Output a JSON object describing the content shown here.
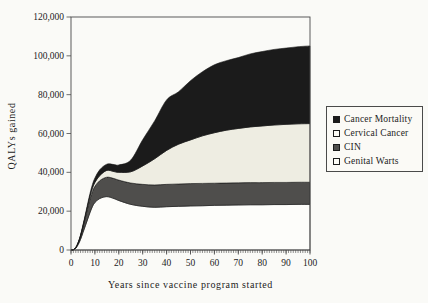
{
  "figure": {
    "background": "#fafaf7",
    "frame_color": "#4a4a4a",
    "text_color": "#1c1c1c"
  },
  "legend": {
    "items": [
      {
        "label": "Cancer Mortality",
        "swatch_fill": "#1b1b1b"
      },
      {
        "label": "Cervical Cancer",
        "swatch_fill": "#fdfcf6"
      },
      {
        "label": "CIN",
        "swatch_fill": "#4f4e4c"
      },
      {
        "label": "Genital Warts",
        "swatch_fill": "#fdfcf6"
      }
    ]
  },
  "chart_data": {
    "type": "area",
    "stacked": true,
    "title": "",
    "xlabel": "Years since vaccine program started",
    "ylabel": "QALYs gained",
    "xlim": [
      0,
      100
    ],
    "ylim": [
      0,
      120000
    ],
    "grid": false,
    "frame": true,
    "legend_position": "right",
    "x": [
      0,
      1,
      2,
      3,
      4,
      5,
      6,
      7,
      8,
      9,
      10,
      12,
      15,
      18,
      20,
      25,
      30,
      35,
      40,
      45,
      50,
      55,
      60,
      65,
      70,
      75,
      80,
      85,
      90,
      95,
      100
    ],
    "series": [
      {
        "name": "Genital Warts",
        "color": "#fdfdfa",
        "values": [
          0,
          100,
          900,
          2800,
          5500,
          9000,
          12500,
          16000,
          19500,
          22500,
          24500,
          26500,
          27500,
          26500,
          25500,
          23500,
          22500,
          22000,
          22300,
          22500,
          22700,
          22800,
          23000,
          23100,
          23200,
          23300,
          23300,
          23400,
          23400,
          23500,
          23500
        ]
      },
      {
        "name": "CIN",
        "color": "#4f4e4c",
        "values": [
          0,
          50,
          300,
          800,
          1600,
          2800,
          4200,
          5800,
          7000,
          7800,
          8300,
          9200,
          10000,
          10300,
          10500,
          11000,
          11300,
          11500,
          11500,
          11500,
          11500,
          11500,
          11400,
          11400,
          11400,
          11400,
          11400,
          11400,
          11400,
          11400,
          11400
        ]
      },
      {
        "name": "Cervical Cancer",
        "color": "#eeede2",
        "values": [
          0,
          0,
          50,
          150,
          300,
          500,
          800,
          1100,
          1400,
          1700,
          2000,
          2600,
          3500,
          3600,
          4000,
          5800,
          9500,
          13500,
          17500,
          20500,
          22500,
          24500,
          26000,
          27200,
          28000,
          28700,
          29200,
          29600,
          29900,
          30100,
          30200
        ]
      },
      {
        "name": "Cancer Mortality",
        "color": "#1b1b1b",
        "values": [
          0,
          0,
          50,
          150,
          300,
          500,
          800,
          1100,
          1500,
          1900,
          2300,
          3000,
          3200,
          3600,
          3800,
          6000,
          13500,
          19500,
          26000,
          27000,
          30500,
          33000,
          35000,
          35800,
          36500,
          37600,
          38300,
          38900,
          39300,
          39700,
          40000
        ]
      }
    ],
    "yticks": {
      "values": [
        0,
        20000,
        40000,
        60000,
        80000,
        100000,
        120000
      ],
      "labels": [
        "0",
        "20,000",
        "40,000",
        "60,000",
        "80,000",
        "100,000",
        "120,000"
      ]
    },
    "xticks": {
      "values": [
        0,
        10,
        20,
        30,
        40,
        50,
        60,
        70,
        80,
        90,
        100
      ],
      "labels": [
        "0",
        "10",
        "20",
        "30",
        "40",
        "50",
        "60",
        "70",
        "80",
        "90",
        "100"
      ],
      "minor_step": 1
    }
  }
}
